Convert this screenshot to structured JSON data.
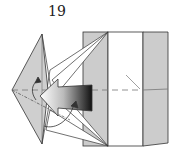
{
  "diagram": {
    "step_number": "19",
    "type": "origami-folding-step",
    "elements": [
      {
        "name": "left-kite-flap",
        "fill": "#cfcfcf"
      },
      {
        "name": "left-gray-strip",
        "fill": "#cccccc"
      },
      {
        "name": "center-white-panel",
        "fill": "#ffffff"
      },
      {
        "name": "right-gray-strip",
        "fill": "#cccccc"
      },
      {
        "name": "push-arrow",
        "direction": "left",
        "gradient": [
          "#ffffff",
          "#111111"
        ]
      },
      {
        "name": "valley-fold-line",
        "style": "dashed"
      },
      {
        "name": "rotation-arrows",
        "count": 2
      }
    ],
    "colors": {
      "paper_colored": "#cccccc",
      "paper_white": "#ffffff",
      "line": "#333333",
      "fold_line": "#888888"
    }
  }
}
